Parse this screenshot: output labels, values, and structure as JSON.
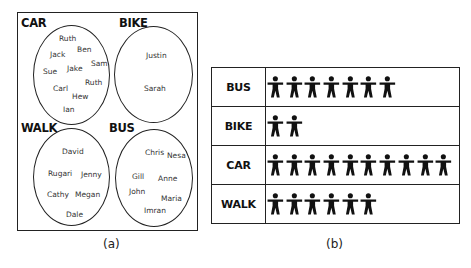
{
  "panel_a": {
    "caption": "(a)",
    "groups": [
      {
        "label": "CAR",
        "names": [
          "Ruth",
          "Ben",
          "Jack",
          "Sam",
          "Sue",
          "Jake",
          "Ruth",
          "Carl",
          "Hew",
          "Ian"
        ]
      },
      {
        "label": "BIKE",
        "names": [
          "Justin",
          "Sarah"
        ]
      },
      {
        "label": "WALK",
        "names": [
          "David",
          "Rugari",
          "Jenny",
          "Cathy",
          "Megan",
          "Dale"
        ]
      },
      {
        "label": "BUS",
        "names": [
          "Chris",
          "Nesa",
          "Gill",
          "Anne",
          "John",
          "Maria",
          "Imran"
        ]
      }
    ]
  },
  "panel_b": {
    "caption": "(b)",
    "icon": "person-icon",
    "rows": [
      {
        "label": "BUS",
        "count": 7
      },
      {
        "label": "BIKE",
        "count": 2
      },
      {
        "label": "CAR",
        "count": 10
      },
      {
        "label": "WALK",
        "count": 6
      }
    ]
  },
  "chart_data": {
    "type": "pictogram",
    "title": "",
    "categories": [
      "BUS",
      "BIKE",
      "CAR",
      "WALK"
    ],
    "values": [
      7,
      2,
      10,
      6
    ],
    "unit": "1 figure = 1 person"
  }
}
